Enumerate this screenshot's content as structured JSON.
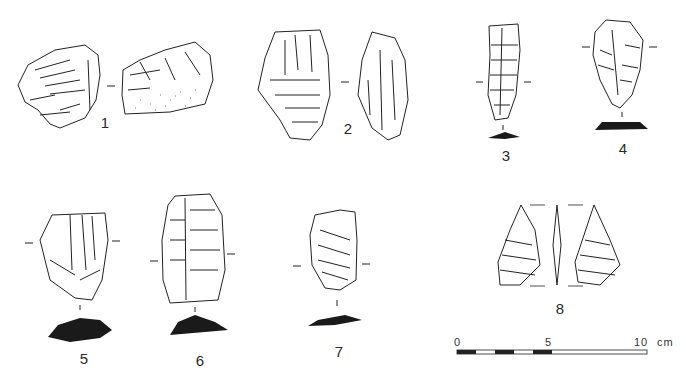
{
  "plate": {
    "artifacts": [
      {
        "id": "1",
        "label": "1",
        "views": 2,
        "section": false
      },
      {
        "id": "2",
        "label": "2",
        "views": 2,
        "section": false
      },
      {
        "id": "3",
        "label": "3",
        "views": 1,
        "section": true
      },
      {
        "id": "4",
        "label": "4",
        "views": 1,
        "section": true
      },
      {
        "id": "5",
        "label": "5",
        "views": 1,
        "section": true
      },
      {
        "id": "6",
        "label": "6",
        "views": 1,
        "section": true
      },
      {
        "id": "7",
        "label": "7",
        "views": 1,
        "section": true
      },
      {
        "id": "8",
        "label": "8",
        "views": 3,
        "section": false
      }
    ],
    "scale_bar": {
      "tick_0": "0",
      "tick_5": "5",
      "tick_10": "10",
      "unit": "cm"
    },
    "colors": {
      "ink": "#222222",
      "section_fill": "#1a1a1a",
      "background": "#ffffff"
    }
  }
}
